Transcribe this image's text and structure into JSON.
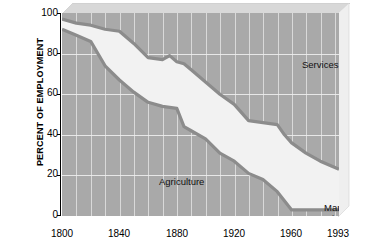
{
  "chart_data": {
    "type": "area",
    "title": "",
    "subtitle": "",
    "xlabel": "",
    "ylabel": "PERCENT OF EMPLOYMENT",
    "xlim": [
      1800,
      1993
    ],
    "ylim": [
      0,
      100
    ],
    "grid": true,
    "legend_position": "inline-annotations",
    "xtick_labels": [
      "1800",
      "1840",
      "1880",
      "1920",
      "1960",
      "1993"
    ],
    "xtick_values": [
      1800,
      1840,
      1880,
      1920,
      1960,
      1993
    ],
    "ytick_labels": [
      "0",
      "20",
      "40",
      "60",
      "80",
      "100"
    ],
    "ytick_values": [
      0,
      20,
      40,
      60,
      80,
      100
    ],
    "stacking": "cumulative-from-bottom",
    "annotations": [
      {
        "name": "services",
        "text": "Services"
      },
      {
        "name": "agriculture",
        "text": "Agriculture"
      },
      {
        "name": "manufacturing",
        "text": "Manufacturing, mining, and construction"
      }
    ],
    "boundaries": {
      "agriculture_top": {
        "label": "Agriculture (cumulative top)",
        "x": [
          1800,
          1810,
          1820,
          1830,
          1840,
          1850,
          1860,
          1870,
          1880,
          1885,
          1890,
          1900,
          1910,
          1920,
          1930,
          1940,
          1950,
          1960,
          1970,
          1980,
          1993
        ],
        "y": [
          92,
          89,
          86,
          74,
          67,
          61,
          56,
          54,
          53,
          44,
          42,
          38,
          31,
          27,
          21,
          18,
          12,
          3,
          3,
          3,
          3
        ]
      },
      "manufacturing_top": {
        "label": "Agriculture + Manufacturing/mining/construction (cumulative top)",
        "x": [
          1800,
          1810,
          1820,
          1830,
          1840,
          1850,
          1860,
          1870,
          1875,
          1880,
          1885,
          1890,
          1900,
          1910,
          1920,
          1930,
          1940,
          1950,
          1955,
          1960,
          1970,
          1980,
          1993
        ],
        "y": [
          97,
          95,
          94,
          92,
          91,
          85,
          78,
          77,
          79,
          76,
          75,
          72,
          66,
          60,
          55,
          47,
          46,
          45,
          40,
          36,
          31,
          27,
          23
        ]
      }
    },
    "series": [
      {
        "name": "Agriculture",
        "x": [
          1800,
          1810,
          1820,
          1830,
          1840,
          1850,
          1860,
          1870,
          1880,
          1885,
          1890,
          1900,
          1910,
          1920,
          1930,
          1940,
          1950,
          1960,
          1970,
          1980,
          1993
        ],
        "values": [
          92,
          89,
          86,
          74,
          67,
          61,
          56,
          54,
          53,
          44,
          42,
          38,
          31,
          27,
          21,
          18,
          12,
          3,
          3,
          3,
          3
        ]
      },
      {
        "name": "Manufacturing, mining, and construction",
        "x": [
          1800,
          1820,
          1840,
          1860,
          1880,
          1900,
          1920,
          1940,
          1960,
          1980,
          1993
        ],
        "values": [
          5,
          8,
          24,
          22,
          23,
          28,
          28,
          28,
          33,
          24,
          20
        ]
      },
      {
        "name": "Services",
        "x": [
          1800,
          1820,
          1840,
          1860,
          1880,
          1900,
          1920,
          1940,
          1960,
          1980,
          1993
        ],
        "values": [
          3,
          6,
          9,
          22,
          24,
          34,
          45,
          54,
          64,
          73,
          77
        ]
      }
    ],
    "colors": {
      "plot_background": "#a9a9a9",
      "band_fill": "#f2f2f2",
      "boundary_line": "#8c8c8c",
      "gridline": "#e2e2e2",
      "axis": "#000000",
      "bevel_top": "#d6d6d6",
      "bevel_right": "#f2f2f2"
    }
  },
  "axes": {
    "y_title": "PERCENT OF EMPLOYMENT",
    "y_ticks": [
      "100",
      "80",
      "60",
      "40",
      "20",
      "0"
    ],
    "x_ticks": [
      "1800",
      "1840",
      "1880",
      "1920",
      "1960",
      "1993"
    ]
  },
  "labels": {
    "services": "Services",
    "agriculture": "Agriculture",
    "manufacturing_line1": "Manufacturing,",
    "manufacturing_line2": "mining, and",
    "manufacturing_line3": "construction"
  }
}
